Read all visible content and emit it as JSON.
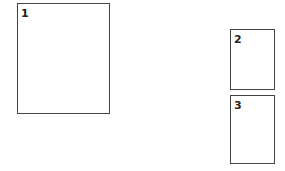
{
  "diagram": {
    "boxes": [
      {
        "label": "1",
        "x": 17,
        "y": 3,
        "w": 93,
        "h": 111
      },
      {
        "label": "2",
        "x": 230,
        "y": 29,
        "w": 45,
        "h": 61
      },
      {
        "label": "3",
        "x": 230,
        "y": 95,
        "w": 45,
        "h": 69
      }
    ],
    "colors": {
      "border": "#444444",
      "background": "#ffffff",
      "text": "#222222"
    }
  }
}
